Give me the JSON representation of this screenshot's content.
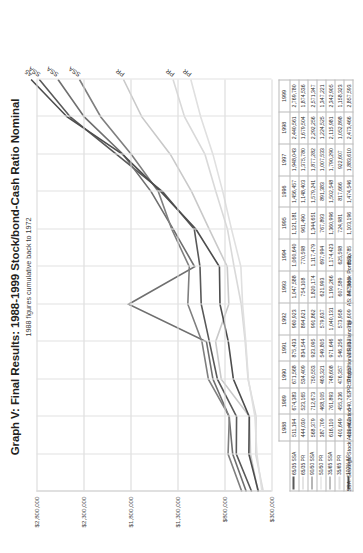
{
  "header": {
    "title": "Graph V: Final Results: 1988-1999 Stock/bond-Cash Ratio Nominal",
    "subtitle": "1988 figures cumulative back to 1972"
  },
  "footnote": {
    "ssa": "SSA: Strategic Stock Accumulation",
    "pr": "PR: Proportional Rebalancing",
    "as": "AS: All Stock Portfolio"
  },
  "chart_data": {
    "type": "line",
    "title": "Graph V: Final Results: 1988-1999 Stock/bond-Cash Ratio Nominal",
    "subtitle": "1988 figures cumulative back to 1972",
    "xlabel": "",
    "ylabel": "",
    "grid": true,
    "legend_position": "table-row-headers",
    "ylim": [
      300000,
      2800000
    ],
    "yticks": [
      300000,
      800000,
      1300000,
      1800000,
      2300000,
      2800000
    ],
    "ytick_labels": [
      "$300,000",
      "$800,000",
      "$1,300,000",
      "$1,800,000",
      "$2,300,000",
      "$2,800,000"
    ],
    "categories": [
      "1988",
      "1989",
      "1990",
      "1991",
      "1992",
      "1993",
      "1994",
      "1995",
      "1996",
      "1997",
      "1998",
      "1999"
    ],
    "series": [
      {
        "name": "65/35 SSA",
        "end_label": "SSA",
        "color": "#595959",
        "values": [
          511194,
          674383,
          671568,
          875433,
          960923,
          1047588,
          1060640,
          1121181,
          1456457,
          1948043,
          2440561,
          2769780
        ],
        "values_text": [
          "511,194",
          "674,383",
          "671,568",
          "875,433",
          "960,923",
          "1,047,588",
          "1,060,640",
          "1,121,181",
          "1,456,457",
          "1,948,043",
          "2,440,561",
          "2,769,780"
        ]
      },
      {
        "name": "65/35 PR",
        "end_label": "PR",
        "color": "#c9c9c9",
        "values": [
          444030,
          523165,
          534409,
          834544,
          894621,
          754108,
          770598,
          961490,
          1148403,
          1375780,
          1679504,
          1874536
        ],
        "values_text": [
          "444,030",
          "523,165",
          "534,409",
          "834,544",
          "894,621",
          "754,108",
          "770,598",
          "961,490",
          "1,148,403",
          "1,375,780",
          "1,679,504",
          "1,874,536"
        ]
      },
      {
        "name": "90/50 SSA",
        "end_label": "SSA",
        "color": "#6f6f6f",
        "values": [
          568379,
          712673,
          750553,
          923095,
          991862,
          1820174,
          1117479,
          1344651,
          1579241,
          1877282,
          2292256,
          2571347
        ],
        "values_text": [
          "568,379",
          "712,673",
          "750,553",
          "923,095",
          "991,862",
          "1,820,174",
          "1,117,479",
          "1,344,651",
          "1,579,241",
          "1,877,282",
          "2,292,256",
          "2,571,347"
        ]
      },
      {
        "name": "50/50 PR",
        "end_label": "PR",
        "color": "#d9d9d9",
        "values": [
          387709,
          468105,
          463321,
          549805,
          579637,
          621993,
          697994,
          767893,
          891383,
          1007533,
          1224525,
          1347221
        ],
        "values_text": [
          "387,709",
          "468,105",
          "463,321",
          "549,805",
          "579,637",
          "621,993",
          "697,994",
          "767,893",
          "891,383",
          "1,007,533",
          "1,224,525",
          "1,347,221"
        ]
      },
      {
        "name": "35/65 SSA",
        "end_label": "SSA",
        "color": "#7f7f7f",
        "values": [
          616110,
          761893,
          748608,
          971646,
          1040131,
          1190266,
          1174423,
          1360996,
          1502548,
          1790290,
          2115981,
          2342905
        ],
        "values_text": [
          "616,110",
          "761,893",
          "748,608",
          "971,646",
          "1,040,131",
          "1,190,266",
          "1,174,423",
          "1,360,996",
          "1,502,548",
          "1,790,290",
          "2,115,981",
          "2,342,905"
        ]
      },
      {
        "name": "35/65 PR",
        "end_label": "PR",
        "color": "#e0e0e0",
        "values": [
          401649,
          455236,
          476357,
          546256,
          573958,
          607589,
          625598,
          724981,
          817666,
          922607,
          1052898,
          1158323
        ],
        "values_text": [
          "401,649",
          "455,236",
          "476,357",
          "546,256",
          "573,958",
          "607,589",
          "625,598",
          "724,981",
          "817,666",
          "922,607",
          "1,052,898",
          "1,158,323"
        ]
      },
      {
        "name": "100% AS",
        "end_label": "A5",
        "color": "#4d4d4d",
        "values": [
          439462,
          540762,
          536657,
          705737,
          759609,
          847989,
          853785,
          1103196,
          1474546,
          1883610,
          2473466,
          2857593
        ],
        "values_text": [
          "439,462",
          "540,762",
          "536,657",
          "705,737",
          "759,609",
          "847,989",
          "853,785",
          "1,103,196",
          "1,474,546",
          "1,883,610",
          "2,473,466",
          "2,857,593"
        ]
      }
    ]
  }
}
